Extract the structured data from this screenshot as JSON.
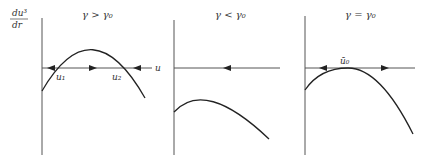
{
  "y_axis_label": {
    "numerator": "du³",
    "denominator": "dr"
  },
  "x_axis_label": "u",
  "panels": [
    {
      "title": "γ > γ₀",
      "roots": [
        "u₁",
        "u₂"
      ],
      "arrows": [
        "left",
        "right",
        "left"
      ]
    },
    {
      "title": "γ < γ₀",
      "roots": [],
      "arrows": [
        "left"
      ]
    },
    {
      "title": "γ = γ₀",
      "roots": [
        "ū₀"
      ],
      "arrows": [
        "left",
        "right"
      ]
    }
  ]
}
